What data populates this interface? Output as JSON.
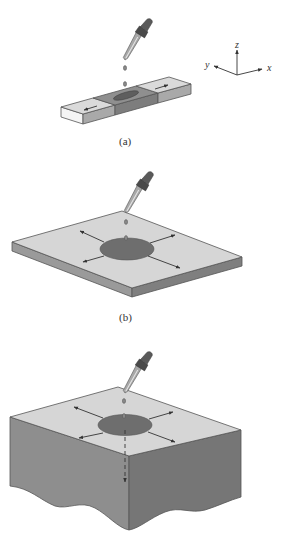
{
  "figure": {
    "panels": [
      {
        "id": "a",
        "label": "(a)",
        "description": "Dropper dispensing drop onto a narrow strip; liquid spreads in one dimension"
      },
      {
        "id": "b",
        "label": "(b)",
        "description": "Dropper dispensing drop onto a thin plate; liquid spreads radially in two dimensions"
      },
      {
        "id": "c",
        "label": "",
        "description": "Dropper dispensing drop onto a thick block; liquid spreads radially and downward in three dimensions"
      }
    ],
    "axes": {
      "x": "x",
      "y": "y",
      "z": "z"
    },
    "colors": {
      "surface_light": "#d6d6d6",
      "surface_white": "#f2f2f2",
      "side_mid": "#9a9a9a",
      "side_dark": "#7d7d7d",
      "spot": "#6e6e6e",
      "outline": "#555555",
      "arrow": "#333333"
    }
  }
}
